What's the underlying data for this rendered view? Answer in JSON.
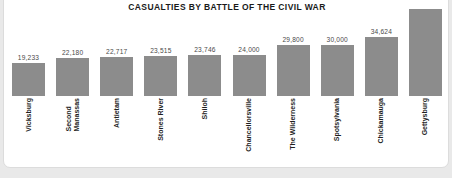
{
  "card": {
    "background": "#ffffff",
    "border_color": "#dcdcdc"
  },
  "chart_data": {
    "type": "bar",
    "title": "CASUALTIES BY BATTLE OF THE CIVIL WAR",
    "xlabel": "",
    "ylabel": "",
    "ylim": [
      0,
      51000
    ],
    "grid": false,
    "legend": null,
    "bar_color": "#8c8c8c",
    "categories": [
      "Vicksburg",
      "Second Manassas",
      "Antietam",
      "Stones River",
      "Shiloh",
      "Chancellorsville",
      "The Wilderness",
      "Spotsylvania",
      "Chickamauga",
      "Gettysburg"
    ],
    "values": [
      19233,
      22180,
      22717,
      23515,
      23746,
      24000,
      29800,
      30000,
      34624,
      51000
    ],
    "value_labels": [
      "19,233",
      "22,180",
      "22,717",
      "23,515",
      "23,746",
      "24,000",
      "29,800",
      "30,000",
      "34,624",
      ""
    ],
    "category_lines": [
      [
        "Vicksburg"
      ],
      [
        "Second",
        "Manassas"
      ],
      [
        "Antietam"
      ],
      [
        "Stones River"
      ],
      [
        "Shiloh"
      ],
      [
        "Chancellorsville"
      ],
      [
        "The Wilderness"
      ],
      [
        "Spotsylvania"
      ],
      [
        "Chickamauga"
      ],
      [
        "Gettysburg"
      ]
    ]
  }
}
